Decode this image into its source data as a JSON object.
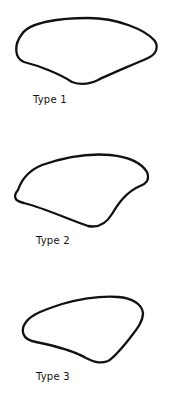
{
  "figure": {
    "stroke_color": "#111111",
    "background": "#ffffff",
    "shapes": [
      {
        "id": "type-1",
        "label": "Type 1"
      },
      {
        "id": "type-2",
        "label": "Type 2"
      },
      {
        "id": "type-3",
        "label": "Type 3"
      }
    ]
  }
}
